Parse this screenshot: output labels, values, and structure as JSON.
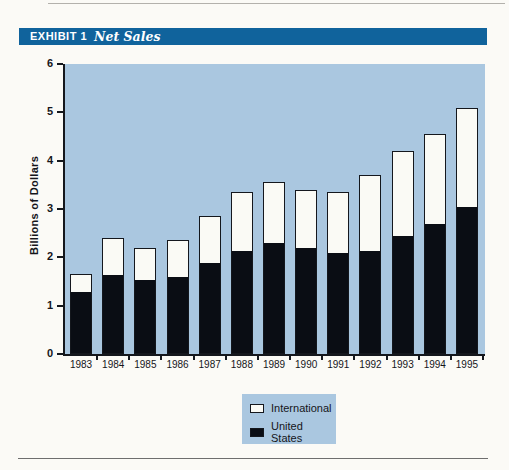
{
  "header": {
    "exhibit_label": "EXHIBIT 1",
    "title": "Net Sales"
  },
  "colors": {
    "page_background": "#fbfaf6",
    "header_bar": "#10639c",
    "header_text": "#ffffff",
    "plot_background": "#aac7e0",
    "bar_outline": "#14171d",
    "united_states_fill": "#0a0d14",
    "international_fill": "#fafaf5",
    "axis": "#14171d",
    "text": "#15151a",
    "rule_top": "#b3b1ac",
    "rule_bottom": "#6e6e6e"
  },
  "chart_data": {
    "type": "bar",
    "stacked": true,
    "title": "Net Sales",
    "categories": [
      "1983",
      "1984",
      "1985",
      "1986",
      "1987",
      "1988",
      "1989",
      "1990",
      "1991",
      "1992",
      "1993",
      "1994",
      "1995"
    ],
    "series": [
      {
        "name": "United States",
        "color": "#0a0d14",
        "values": [
          1.3,
          1.65,
          1.55,
          1.6,
          1.9,
          2.15,
          2.3,
          2.2,
          2.1,
          2.15,
          2.45,
          2.7,
          3.05
        ]
      },
      {
        "name": "International",
        "color": "#fafaf5",
        "values": [
          0.35,
          0.75,
          0.65,
          0.75,
          0.95,
          1.2,
          1.25,
          1.2,
          1.25,
          1.55,
          1.75,
          1.85,
          2.05
        ]
      }
    ],
    "totals": [
      1.65,
      2.4,
      2.2,
      2.35,
      2.85,
      3.35,
      3.55,
      3.4,
      3.35,
      3.7,
      4.2,
      4.55,
      5.1
    ],
    "legend_order": [
      "International",
      "United States"
    ],
    "xlabel": "",
    "ylabel": "Billions of Dollars",
    "ylim": [
      0,
      6
    ],
    "yticks": [
      0,
      1,
      2,
      3,
      4,
      5,
      6
    ],
    "grid": false,
    "legend_position": "bottom-center"
  }
}
